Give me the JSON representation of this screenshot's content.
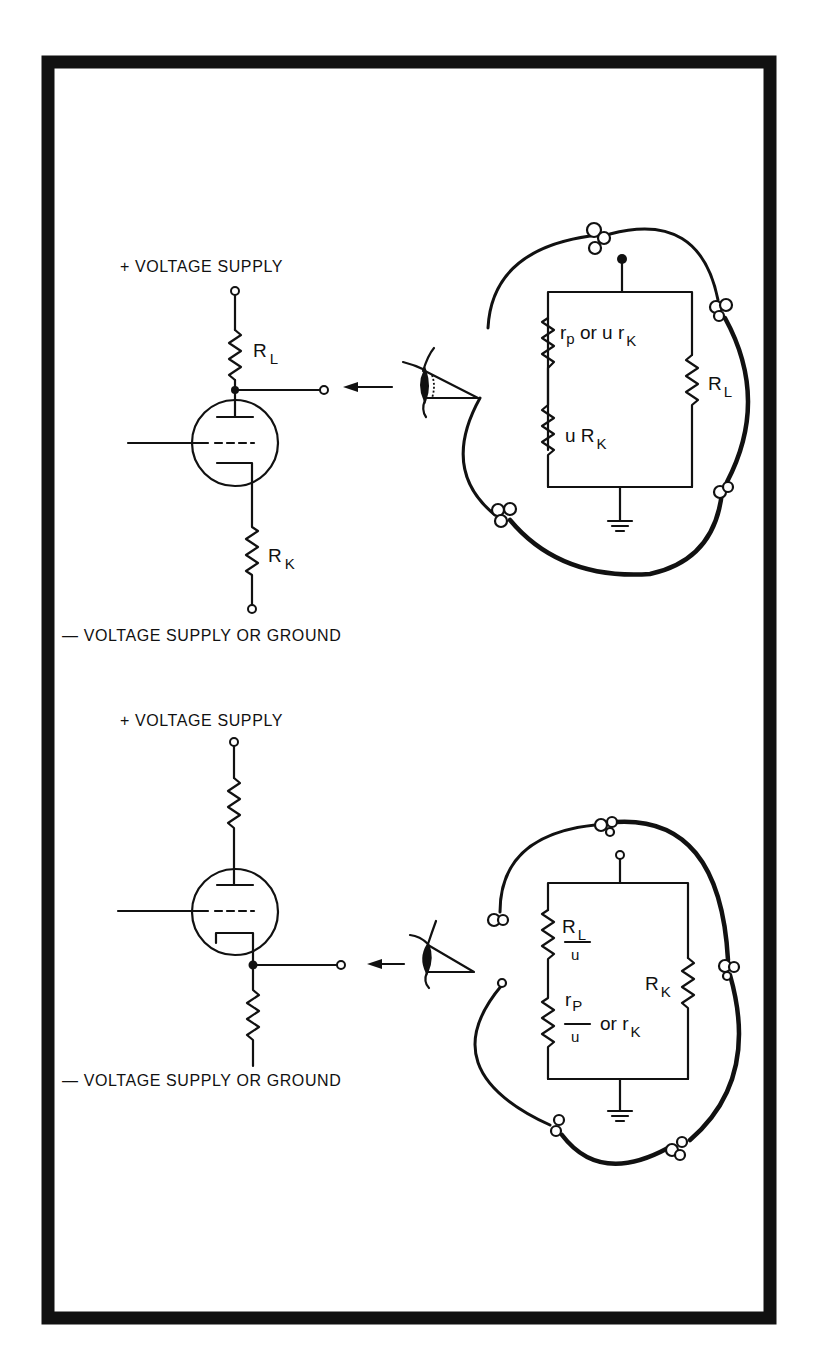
{
  "figure": {
    "frame_color": "#111111",
    "background": "#ffffff"
  },
  "diagram_top": {
    "title": "Plate-output (common cathode) stage viewed from the plate",
    "supply_top_label": "+ VOLTAGE SUPPLY",
    "supply_bottom_label": "— VOLTAGE  SUPPLY OR GROUND",
    "schematic": {
      "load_resistor": {
        "symbol": "R",
        "subscript": "L"
      },
      "cathode_resistor": {
        "symbol": "R",
        "subscript": "K"
      }
    },
    "equivalent_circuit": {
      "left_branch_upper": {
        "text_a": "r",
        "sub_a": "p",
        "mid": " or u r",
        "sub_b": "K"
      },
      "left_branch_lower": {
        "prefix": "u R",
        "subscript": "K"
      },
      "right_branch": {
        "symbol": "R",
        "subscript": "L"
      }
    }
  },
  "diagram_bottom": {
    "title": "Cathode-output (cathode follower) stage viewed from the cathode",
    "supply_top_label": "+ VOLTAGE SUPPLY",
    "supply_bottom_label": "— VOLTAGE SUPPLY  OR GROUND",
    "equivalent_circuit": {
      "left_branch_upper": {
        "numerator": "R",
        "numerator_sub": "L",
        "denominator": "u"
      },
      "left_branch_lower": {
        "numerator": "r",
        "numerator_sub": "P",
        "denominator": "u",
        "suffix": "or r",
        "suffix_sub": "K"
      },
      "right_branch": {
        "symbol": "R",
        "subscript": "K"
      }
    }
  }
}
